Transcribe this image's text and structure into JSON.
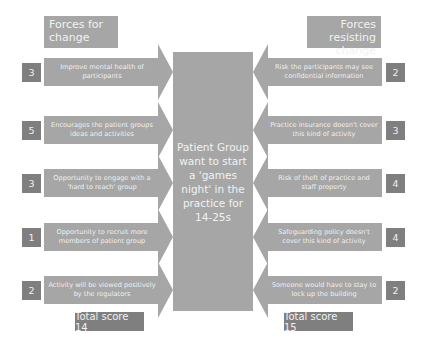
{
  "diagram": {
    "left_header": "Forces for change",
    "right_header": "Forces resisting change",
    "center": "Patient Group want to start a 'games night' in the practice for 14-25s",
    "forces_for": [
      {
        "text": "Improve mental health of participants",
        "score": "3"
      },
      {
        "text": "Encourages the patient groups ideas and activities",
        "score": "5"
      },
      {
        "text": "Opportunity to engage with a 'hard to reach' group",
        "score": "3"
      },
      {
        "text": "Opportunity to recruit more members of patient group",
        "score": "1"
      },
      {
        "text": "Activity will be viewed positively by the regulators",
        "score": "2"
      }
    ],
    "forces_against": [
      {
        "text": "Risk the participants may see confidential information",
        "score": "2"
      },
      {
        "text": "Practice insurance doesn't cover this kind of activity",
        "score": "3"
      },
      {
        "text": "Risk of theft of practice and staff property",
        "score": "4"
      },
      {
        "text": "Safeguarding policy doesn't cover this kind of activity",
        "score": "4"
      },
      {
        "text": "Someone would have to stay to lock up the building",
        "score": "2"
      }
    ],
    "total_for": "Total score 14",
    "total_against": "Total score 15"
  },
  "colors": {
    "arrow_fill": "#a6a6a6",
    "score_box": "#7f7f7f",
    "text_light": "#f2f2f2",
    "background": "#ffffff"
  }
}
